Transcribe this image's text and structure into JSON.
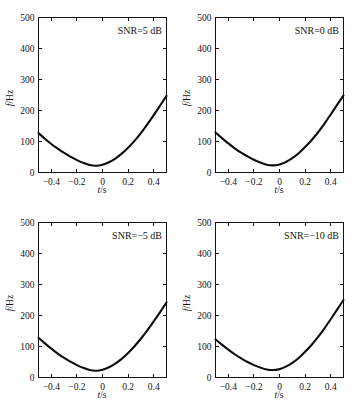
{
  "figure": {
    "background": "#ffffff",
    "curve_color": "#0d0d0d",
    "axis_color": "#141414",
    "panel_count": 4
  },
  "chart_data": [
    {
      "type": "line",
      "title": "",
      "annotation": "SNR=5 dB",
      "xlabel": "t/s",
      "ylabel": "f/Hz",
      "xlim": [
        -0.5,
        0.5
      ],
      "ylim": [
        0,
        500
      ],
      "xticks": [
        -0.4,
        -0.2,
        0,
        0.2,
        0.4
      ],
      "xticklabels": [
        "−0.4",
        "−0.2",
        "0",
        "0.2",
        "0.4"
      ],
      "yticks": [
        0,
        100,
        200,
        300,
        400,
        500
      ],
      "yticklabels": [
        "0",
        "100",
        "200",
        "300",
        "400",
        "500"
      ],
      "grid": false,
      "legend": "none",
      "series": [
        {
          "name": "instantaneous frequency",
          "x": [
            -0.5,
            -0.45,
            -0.4,
            -0.35,
            -0.3,
            -0.25,
            -0.2,
            -0.15,
            -0.1,
            -0.05,
            0.0,
            0.05,
            0.1,
            0.15,
            0.2,
            0.25,
            0.3,
            0.35,
            0.4,
            0.45,
            0.5
          ],
          "y": [
            127,
            109,
            92,
            77,
            63,
            51,
            40,
            31,
            24,
            22,
            25,
            33,
            45,
            61,
            80,
            102,
            127,
            155,
            185,
            216,
            247
          ]
        }
      ]
    },
    {
      "type": "line",
      "title": "",
      "annotation": "SNR=0 dB",
      "xlabel": "t/s",
      "ylabel": "f/Hz",
      "xlim": [
        -0.5,
        0.5
      ],
      "ylim": [
        0,
        500
      ],
      "xticks": [
        -0.4,
        -0.2,
        0,
        0.2,
        0.4
      ],
      "xticklabels": [
        "−0.4",
        "−0.2",
        "0",
        "0.2",
        "0.4"
      ],
      "yticks": [
        0,
        100,
        200,
        300,
        400,
        500
      ],
      "yticklabels": [
        "0",
        "100",
        "200",
        "300",
        "400",
        "500"
      ],
      "grid": false,
      "legend": "none",
      "series": [
        {
          "name": "instantaneous frequency",
          "x": [
            -0.5,
            -0.45,
            -0.4,
            -0.35,
            -0.3,
            -0.25,
            -0.2,
            -0.15,
            -0.1,
            -0.05,
            0.0,
            0.05,
            0.1,
            0.15,
            0.2,
            0.25,
            0.3,
            0.35,
            0.4,
            0.45,
            0.5
          ],
          "y": [
            129,
            111,
            94,
            78,
            64,
            52,
            41,
            32,
            25,
            23,
            26,
            34,
            46,
            62,
            82,
            104,
            129,
            157,
            187,
            218,
            249
          ]
        }
      ]
    },
    {
      "type": "line",
      "title": "",
      "annotation": "SNR=−5 dB",
      "xlabel": "t/s",
      "ylabel": "f/Hz",
      "xlim": [
        -0.5,
        0.5
      ],
      "ylim": [
        0,
        500
      ],
      "xticks": [
        -0.4,
        -0.2,
        0,
        0.2,
        0.4
      ],
      "xticklabels": [
        "−0.4",
        "−0.2",
        "0",
        "0.2",
        "0.4"
      ],
      "yticks": [
        0,
        100,
        200,
        300,
        400,
        500
      ],
      "yticklabels": [
        "0",
        "100",
        "200",
        "300",
        "400",
        "500"
      ],
      "grid": false,
      "legend": "none",
      "series": [
        {
          "name": "instantaneous frequency",
          "x": [
            -0.5,
            -0.45,
            -0.4,
            -0.35,
            -0.3,
            -0.25,
            -0.2,
            -0.15,
            -0.1,
            -0.05,
            0.0,
            0.05,
            0.1,
            0.15,
            0.2,
            0.25,
            0.3,
            0.35,
            0.4,
            0.45,
            0.5
          ],
          "y": [
            128,
            110,
            93,
            77,
            63,
            51,
            40,
            31,
            24,
            22,
            25,
            33,
            45,
            60,
            79,
            101,
            125,
            152,
            181,
            211,
            242
          ]
        }
      ]
    },
    {
      "type": "line",
      "title": "",
      "annotation": "SNR=−10 dB",
      "xlabel": "t/s",
      "ylabel": "f/Hz",
      "xlim": [
        -0.5,
        0.5
      ],
      "ylim": [
        0,
        500
      ],
      "xticks": [
        -0.4,
        -0.2,
        0,
        0.2,
        0.4
      ],
      "xticklabels": [
        "−0.4",
        "−0.2",
        "0",
        "0.2",
        "0.4"
      ],
      "yticks": [
        0,
        100,
        200,
        300,
        400,
        500
      ],
      "yticklabels": [
        "0",
        "100",
        "200",
        "300",
        "400",
        "500"
      ],
      "grid": false,
      "legend": "none",
      "series": [
        {
          "name": "instantaneous frequency",
          "x": [
            -0.5,
            -0.45,
            -0.4,
            -0.35,
            -0.3,
            -0.25,
            -0.2,
            -0.15,
            -0.1,
            -0.05,
            0.0,
            0.05,
            0.1,
            0.15,
            0.2,
            0.25,
            0.3,
            0.35,
            0.4,
            0.45,
            0.5
          ],
          "y": [
            123,
            106,
            90,
            75,
            62,
            50,
            40,
            32,
            26,
            24,
            27,
            35,
            47,
            63,
            83,
            105,
            130,
            158,
            188,
            219,
            250
          ]
        }
      ]
    }
  ],
  "axis_labels": {
    "x_italic": "t",
    "x_rest": "/s",
    "y_italic": "f",
    "y_rest": "/Hz"
  }
}
